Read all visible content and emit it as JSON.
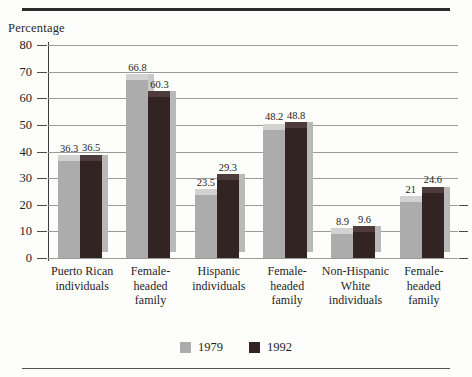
{
  "chart_data": {
    "type": "bar",
    "title": "",
    "ylabel": "Percentage",
    "xlabel": "",
    "ylim": [
      0,
      80
    ],
    "yticks": [
      0,
      10,
      20,
      30,
      40,
      50,
      60,
      70,
      80
    ],
    "grid": true,
    "legend_position": "bottom-center",
    "categories": [
      "Puerto Rican individuals",
      "Female-headed family",
      "Hispanic individuals",
      "Female-headed family",
      "Non-Hispanic White individuals",
      "Female-headed family"
    ],
    "category_lines": [
      [
        "Puerto Rican",
        "individuals"
      ],
      [
        "Female-",
        "headed",
        "family"
      ],
      [
        "Hispanic",
        "individuals"
      ],
      [
        "Female-",
        "headed",
        "family"
      ],
      [
        "Non-Hispanic",
        "White",
        "individuals"
      ],
      [
        "Female-",
        "headed",
        "family"
      ]
    ],
    "series": [
      {
        "name": "1979",
        "color": "#acacac",
        "values": [
          36.3,
          66.8,
          23.5,
          48.2,
          8.9,
          21
        ],
        "labels": [
          "36.3",
          "66.8",
          "23.5",
          "48.2",
          "8.9",
          "21"
        ]
      },
      {
        "name": "1992",
        "color": "#332424",
        "values": [
          36.5,
          60.3,
          29.3,
          48.8,
          9.6,
          24.6
        ],
        "labels": [
          "36.5",
          "60.3",
          "29.3",
          "48.8",
          "9.6",
          "24.6"
        ]
      }
    ]
  },
  "legend": {
    "items": [
      {
        "label": "1979",
        "swatch": "light"
      },
      {
        "label": "1992",
        "swatch": "dark"
      }
    ]
  }
}
